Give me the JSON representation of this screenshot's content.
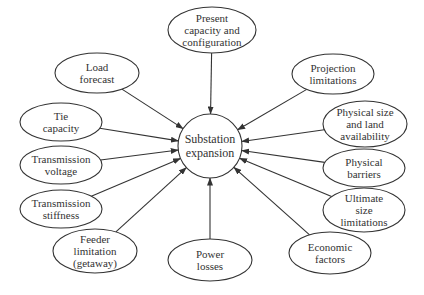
{
  "diagram": {
    "type": "radial-influence-diagram",
    "colors": {
      "stroke": "#333333",
      "text": "#333333",
      "background": "#ffffff"
    },
    "center": {
      "id": "substation-expansion",
      "lines": [
        "Substation",
        "expansion"
      ],
      "cx": 210,
      "cy": 146,
      "r": 32
    },
    "factors": [
      {
        "id": "present-capacity",
        "lines": [
          "Present",
          "capacity and",
          "configuration"
        ],
        "cx": 212,
        "cy": 30,
        "rx": 44,
        "ry": 23
      },
      {
        "id": "projection-limitations",
        "lines": [
          "Projection",
          "limitations"
        ],
        "cx": 333,
        "cy": 74,
        "rx": 41,
        "ry": 20
      },
      {
        "id": "physical-size",
        "lines": [
          "Physical size",
          "and land",
          "availability"
        ],
        "cx": 365,
        "cy": 124,
        "rx": 42,
        "ry": 23
      },
      {
        "id": "physical-barriers",
        "lines": [
          "Physical",
          "barriers"
        ],
        "cx": 364,
        "cy": 168,
        "rx": 41,
        "ry": 19
      },
      {
        "id": "ultimate-size",
        "lines": [
          "Ultimate",
          "size",
          "limitations"
        ],
        "cx": 364,
        "cy": 210,
        "rx": 41,
        "ry": 22
      },
      {
        "id": "economic-factors",
        "lines": [
          "Economic",
          "factors"
        ],
        "cx": 330,
        "cy": 253,
        "rx": 41,
        "ry": 21
      },
      {
        "id": "power-losses",
        "lines": [
          "Power",
          "losses"
        ],
        "cx": 210,
        "cy": 260,
        "rx": 42,
        "ry": 21
      },
      {
        "id": "feeder-limitation",
        "lines": [
          "Feeder",
          "limitation",
          "(getaway)"
        ],
        "cx": 95,
        "cy": 251,
        "rx": 42,
        "ry": 22
      },
      {
        "id": "transmission-stiffness",
        "lines": [
          "Transmission",
          "stiffness"
        ],
        "cx": 61,
        "cy": 209,
        "rx": 41,
        "ry": 19
      },
      {
        "id": "transmission-voltage",
        "lines": [
          "Transmission",
          "voltage"
        ],
        "cx": 61,
        "cy": 165,
        "rx": 41,
        "ry": 19
      },
      {
        "id": "tie-capacity",
        "lines": [
          "Tie",
          "capacity"
        ],
        "cx": 61,
        "cy": 122,
        "rx": 41,
        "ry": 19
      },
      {
        "id": "load-forecast",
        "lines": [
          "Load",
          "forecast"
        ],
        "cx": 97,
        "cy": 73,
        "rx": 42,
        "ry": 20
      }
    ]
  }
}
